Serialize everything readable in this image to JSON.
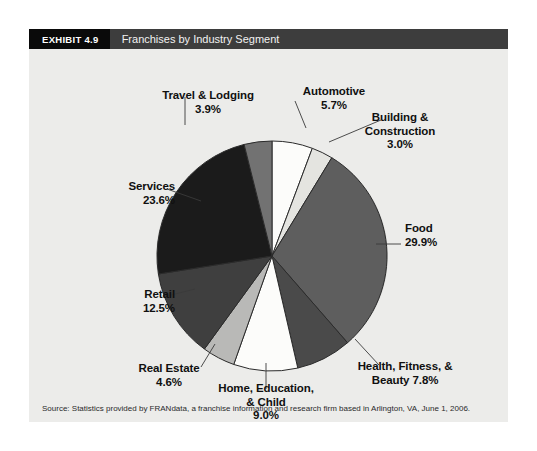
{
  "exhibit": {
    "number_label": "EXHIBIT 4.9",
    "title": "Franchises by Industry Segment",
    "source_note": "Source: Statistics provided by FRANdata, a franchise information and research firm based in Arlington, VA, June 1, 2006."
  },
  "colors": {
    "page_background": "#ffffff",
    "panel_background": "#ececea",
    "header_number_background": "#0a0a0a",
    "header_title_background": "#3d3d3d",
    "header_text": "#f2f2f2",
    "label_text": "#101010",
    "slice_outline": "#2b2b2b",
    "leader_line": "#3a3a3a"
  },
  "labels": {
    "travel_lodging": "Travel & Lodging\n3.9%",
    "automotive": "Automotive\n5.7%",
    "building_construction": "Building &\nConstruction\n3.0%",
    "food": "Food\n29.9%",
    "health_fitness_beauty": "Health, Fitness, &\nBeauty 7.8%",
    "home_education_child": "Home, Education,\n& Child\n9.0%",
    "real_estate": "Real Estate\n4.6%",
    "retail": "Retail\n12.5%",
    "services": "Services\n23.6%"
  },
  "chart_data": {
    "type": "pie",
    "title": "Franchises by Industry Segment",
    "xlabel": "",
    "ylabel": "",
    "units": "percent",
    "start_angle_deg": 0,
    "direction": "clockwise",
    "legend": "none (direct labels with leader lines)",
    "categories": [
      "Automotive",
      "Building & Construction",
      "Food",
      "Health, Fitness, & Beauty",
      "Home, Education, & Child",
      "Real Estate",
      "Retail",
      "Services",
      "Travel & Lodging"
    ],
    "values": [
      5.7,
      3.0,
      29.9,
      7.8,
      9.0,
      4.6,
      12.5,
      23.6,
      3.9
    ],
    "total": 100.0,
    "slices": [
      {
        "label": "Automotive",
        "value": 5.7,
        "color": "#fcfcfa"
      },
      {
        "label": "Building & Construction",
        "value": 3.0,
        "color": "#e4e4e0"
      },
      {
        "label": "Food",
        "value": 29.9,
        "color": "#5e5e5e"
      },
      {
        "label": "Health, Fitness, & Beauty",
        "value": 7.8,
        "color": "#4a4a4a"
      },
      {
        "label": "Home, Education, & Child",
        "value": 9.0,
        "color": "#fcfcfa"
      },
      {
        "label": "Real Estate",
        "value": 4.6,
        "color": "#b9b9b7"
      },
      {
        "label": "Retail",
        "value": 12.5,
        "color": "#3f3f3f"
      },
      {
        "label": "Services",
        "value": 23.6,
        "color": "#1b1b1b"
      },
      {
        "label": "Travel & Lodging",
        "value": 3.9,
        "color": "#727272"
      }
    ]
  }
}
